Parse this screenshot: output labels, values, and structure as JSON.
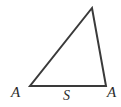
{
  "figure": {
    "background_color": "#ffffff",
    "stroke_color": "#3a3a3a",
    "label_color": "#2b2b2b",
    "stroke_width": 2,
    "labels": {
      "angle_left": "A",
      "angle_right": "A",
      "side_base": "S"
    },
    "geometry": {
      "vertex_bottom_left": [
        30,
        86
      ],
      "vertex_bottom_right": [
        106,
        86
      ],
      "vertex_apex": [
        92,
        8
      ],
      "polygon_points": "30,86 106,86 92,8"
    }
  }
}
